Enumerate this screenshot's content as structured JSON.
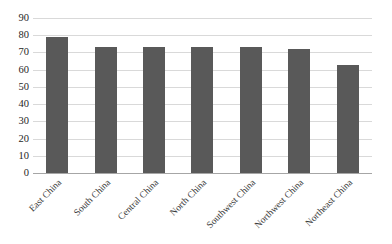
{
  "chart_data": {
    "type": "bar",
    "title": "",
    "subtitle": "",
    "xlabel": "",
    "ylabel": "",
    "categories": [
      "East China",
      "South China",
      "Central China",
      "North China",
      "Southwest China",
      "Northwest China",
      "Northeast China"
    ],
    "values": [
      79,
      73,
      73,
      73,
      73,
      72,
      63
    ],
    "ylim": [
      0,
      90
    ],
    "ytick_step": 10,
    "yticks": [
      0,
      10,
      20,
      30,
      40,
      50,
      60,
      70,
      80,
      90
    ],
    "ytick_labels": [
      "0",
      "10",
      "20",
      "30",
      "40",
      "50",
      "60",
      "70",
      "80",
      "90"
    ],
    "grid": "horizontal",
    "legend": "none",
    "series": [
      {
        "name": "",
        "values": [
          79,
          73,
          73,
          73,
          73,
          72,
          63
        ]
      }
    ]
  },
  "style": {
    "bar_color": "#595959",
    "gridline_color": "#d9d9d9",
    "axis_color": "#a6a6a6",
    "label_color": "#262626",
    "background": "#ffffff"
  }
}
